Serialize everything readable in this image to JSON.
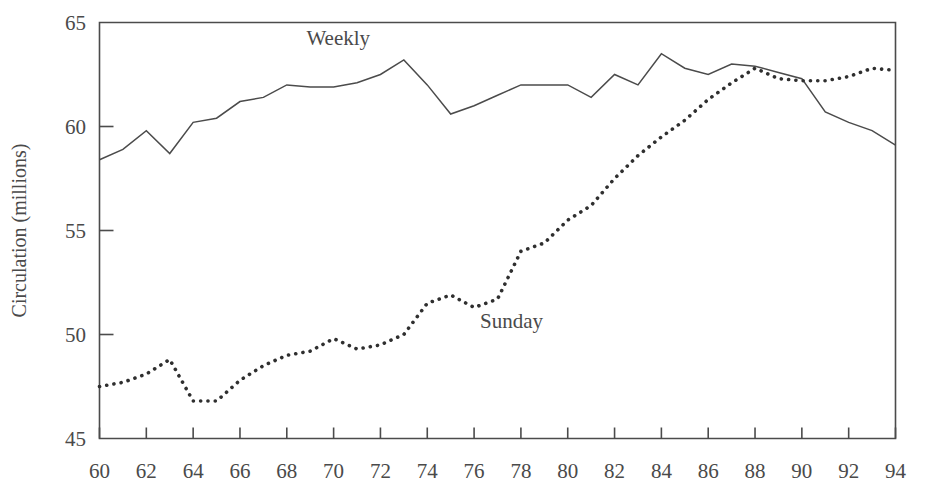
{
  "chart_data": {
    "type": "line",
    "title": "",
    "subtitle": "",
    "xlabel": "",
    "ylabel": "Circulation (millions)",
    "xlim": [
      60,
      94
    ],
    "ylim": [
      45,
      65
    ],
    "grid": false,
    "legend_position": "inline-annotations",
    "x_tick_labels": [
      "60",
      "62",
      "64",
      "66",
      "68",
      "70",
      "72",
      "74",
      "76",
      "78",
      "80",
      "82",
      "84",
      "86",
      "88",
      "90",
      "92",
      "94"
    ],
    "x_tick_values": [
      60,
      62,
      64,
      66,
      68,
      70,
      72,
      74,
      76,
      78,
      80,
      82,
      84,
      86,
      88,
      90,
      92,
      94
    ],
    "y_tick_labels": [
      "45",
      "50",
      "55",
      "60",
      "65"
    ],
    "y_tick_values": [
      45,
      50,
      55,
      60,
      65
    ],
    "x": [
      60,
      61,
      62,
      63,
      64,
      65,
      66,
      67,
      68,
      69,
      70,
      71,
      72,
      73,
      74,
      75,
      76,
      77,
      78,
      79,
      80,
      81,
      82,
      83,
      84,
      85,
      86,
      87,
      88,
      89,
      90,
      91,
      92,
      93,
      94
    ],
    "series": [
      {
        "name": "Weekly",
        "style": "solid",
        "color": "#4b4b4b",
        "label_x": 70.2,
        "label_y": 63.9,
        "values": [
          58.4,
          58.9,
          59.8,
          58.7,
          60.2,
          60.4,
          61.2,
          61.4,
          62.0,
          61.9,
          61.9,
          62.1,
          62.5,
          63.2,
          62.0,
          60.6,
          61.0,
          61.5,
          62.0,
          62.0,
          62.0,
          61.4,
          62.5,
          62.0,
          63.5,
          62.8,
          62.5,
          63.0,
          62.9,
          62.6,
          62.3,
          60.7,
          60.2,
          59.8,
          59.1
        ]
      },
      {
        "name": "Sunday",
        "style": "dotted",
        "color": "#2f2f2f",
        "label_x": 77.6,
        "label_y": 50.3,
        "values": [
          47.5,
          47.7,
          48.1,
          48.8,
          46.8,
          46.8,
          47.8,
          48.5,
          49.0,
          49.2,
          49.8,
          49.3,
          49.5,
          50.0,
          51.5,
          51.9,
          51.3,
          51.7,
          54.0,
          54.4,
          55.5,
          56.2,
          57.5,
          58.6,
          59.5,
          60.3,
          61.3,
          62.1,
          62.8,
          62.3,
          62.2,
          62.2,
          62.4,
          62.8,
          62.7
        ]
      }
    ]
  },
  "annotations": {
    "weekly_label": "Weekly",
    "sunday_label": "Sunday"
  }
}
